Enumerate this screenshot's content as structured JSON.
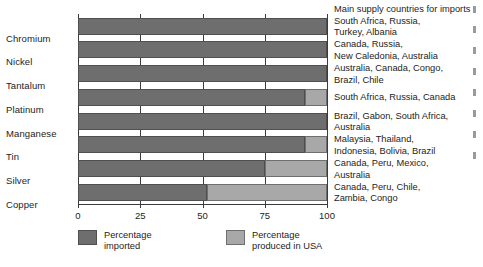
{
  "chart_data": {
    "type": "bar",
    "orientation": "horizontal",
    "stacked": true,
    "title": "",
    "xlabel": "",
    "ylabel": "",
    "xlim": [
      0,
      100
    ],
    "xticks": [
      0,
      25,
      50,
      75,
      100
    ],
    "grid": true,
    "grid_axis": "x",
    "legend_position": "bottom",
    "categories": [
      "Chromium",
      "Nickel",
      "Tantalum",
      "Platinum",
      "Manganese",
      "Tin",
      "Silver",
      "Copper"
    ],
    "series": [
      {
        "name": "Percentage imported",
        "color": "#6e6e6e",
        "values": [
          100,
          100,
          100,
          91,
          100,
          91,
          75,
          52
        ]
      },
      {
        "name": "Percentage produced in USA",
        "color": "#a8a8a8",
        "values": [
          0,
          0,
          0,
          9,
          0,
          9,
          25,
          48
        ]
      }
    ],
    "supply_header": "Main supply countries\nfor imports",
    "supply_countries": [
      "South Africa, Russia,\nTurkey, Albania",
      "Canada, Russia,\nNew Caledonia, Australia",
      "Australia, Canada, Congo,\nBrazil, Chile",
      "South Africa, Russia, Canada",
      "Brazil, Gabon, South Africa,\nAustralia",
      "Malaysia, Thailand,\nIndonesia, Bolivia, Brazil",
      "Canada, Peru, Mexico,\nAustralia",
      "Canada, Peru, Chile,\nZambia, Congo"
    ]
  },
  "legend": {
    "items": [
      {
        "label": "Percentage\nimported",
        "color": "#6e6e6e"
      },
      {
        "label": "Percentage\nproduced in USA",
        "color": "#a8a8a8"
      }
    ]
  },
  "axis": {
    "tick_labels": [
      "0",
      "25",
      "50",
      "75",
      "100"
    ]
  },
  "colors": {
    "imported": "#6e6e6e",
    "domestic": "#a8a8a8",
    "axis": "#3b3b3b",
    "text": "#1d1d1d",
    "background": "#ffffff"
  }
}
